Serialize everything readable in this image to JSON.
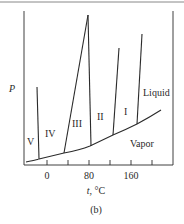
{
  "figure": {
    "caption": "(b)",
    "y_axis_label": "P",
    "x_axis_label_var": "t",
    "x_axis_label_unit": ", °C",
    "x_ticks": [
      {
        "value": 0,
        "label": "0"
      },
      {
        "value": 40,
        "label": ""
      },
      {
        "value": 80,
        "label": "80"
      },
      {
        "value": 120,
        "label": ""
      },
      {
        "value": 160,
        "label": "160"
      },
      {
        "value": 200,
        "label": ""
      }
    ],
    "regions": [
      {
        "id": "V",
        "label": "V"
      },
      {
        "id": "IV",
        "label": "IV"
      },
      {
        "id": "III",
        "label": "III"
      },
      {
        "id": "II",
        "label": "II"
      },
      {
        "id": "I",
        "label": "I"
      },
      {
        "id": "liquid",
        "label": "Liquid"
      },
      {
        "id": "vapor",
        "label": "Vapor"
      }
    ],
    "line_color": "#2a2a2a"
  }
}
